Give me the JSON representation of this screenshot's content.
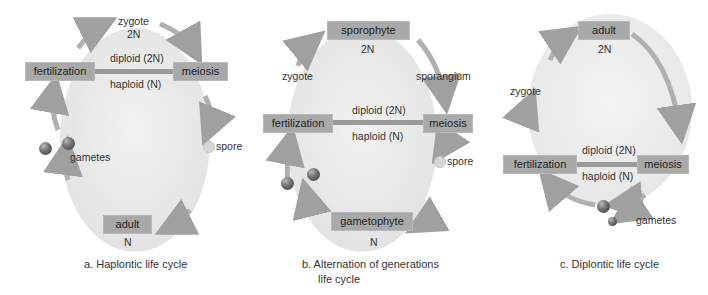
{
  "panels": [
    {
      "id": "a",
      "caption": "a.  Haplontic life cycle",
      "boxes": {
        "top_label": "zygote",
        "top_ploidy": "2N",
        "left": "fertilization",
        "right": "meiosis",
        "bottom": "adult",
        "bottom_ploidy": "N"
      },
      "bar_labels": {
        "diploid": "diploid (2N)",
        "haploid": "haploid (N)"
      },
      "labels": {
        "spore": "spore",
        "gametes": "gametes"
      }
    },
    {
      "id": "b",
      "caption_line1": "b.  Alternation of generations",
      "caption_line2": "life cycle",
      "boxes": {
        "top": "sporophyte",
        "top_ploidy": "2N",
        "left": "fertilization",
        "right": "meiosis",
        "bottom": "gametophyte",
        "bottom_ploidy": "N"
      },
      "bar_labels": {
        "diploid": "diploid (2N)",
        "haploid": "haploid (N)"
      },
      "labels": {
        "zygote": "zygote",
        "sporangium": "sporangium",
        "spore": "spore"
      }
    },
    {
      "id": "c",
      "caption": "c.  Diplontic life cycle",
      "boxes": {
        "top": "adult",
        "top_ploidy": "2N",
        "left": "fertilization",
        "right": "meiosis"
      },
      "bar_labels": {
        "diploid": "diploid (2N)",
        "haploid": "haploid (N)"
      },
      "labels": {
        "zygote": "zygote",
        "gametes": "gametes"
      }
    }
  ],
  "colors": {
    "box": "#a9a9a9",
    "arrow": "#a6a6a6",
    "oval": "#ececec",
    "bar": "#9a9a9a"
  }
}
